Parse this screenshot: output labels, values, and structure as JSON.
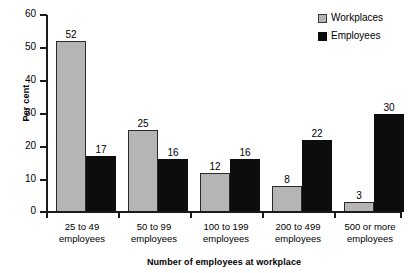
{
  "chart_data": {
    "type": "bar",
    "title": "",
    "xlabel": "Number of employees at workplace",
    "ylabel": "Per cent",
    "ylim": [
      0,
      60
    ],
    "yticks": [
      0,
      10,
      20,
      30,
      40,
      50,
      60
    ],
    "grid": false,
    "legend_position": "top-right",
    "categories": [
      "25 to 49 employees",
      "50 to 99 employees",
      "100 to 199 employees",
      "200 to 499 employees",
      "500 or more employees"
    ],
    "category_lines": [
      {
        "line1": "25 to 49",
        "line2": "employees"
      },
      {
        "line1": "50 to 99",
        "line2": "employees"
      },
      {
        "line1": "100 to 199",
        "line2": "employees"
      },
      {
        "line1": "200 to 499",
        "line2": "employees"
      },
      {
        "line1": "500 or more",
        "line2": "employees"
      }
    ],
    "series": [
      {
        "name": "Workplaces",
        "color": "#b5b5b5",
        "values": [
          52,
          25,
          12,
          8,
          3
        ],
        "labels": [
          "52",
          "25",
          "12",
          "8",
          "3"
        ]
      },
      {
        "name": "Employees",
        "color": "#0d0d0d",
        "values": [
          17,
          16,
          16,
          22,
          30
        ],
        "labels": [
          "17",
          "16",
          "16",
          "22",
          "30"
        ]
      }
    ]
  },
  "axis": {
    "y_title": "Per cent",
    "x_title": "Number of employees at workplace",
    "y_tick_labels": [
      "0",
      "10",
      "20",
      "30",
      "40",
      "50",
      "60"
    ]
  },
  "legend": {
    "items": [
      {
        "label": "Workplaces"
      },
      {
        "label": "Employees"
      }
    ]
  }
}
